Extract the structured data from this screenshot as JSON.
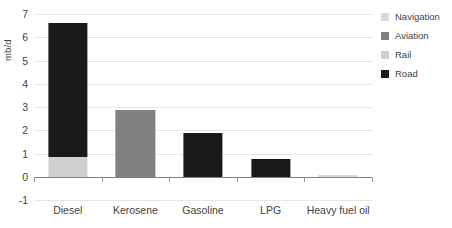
{
  "chart_data": {
    "type": "bar",
    "title": "",
    "subtitle": "",
    "xlabel": "",
    "ylabel": "mb/d",
    "ylim": [
      -1,
      7
    ],
    "ytick_labels": [
      "7",
      "6",
      "5",
      "4",
      "3",
      "2",
      "1",
      "0",
      "-1"
    ],
    "ytick_values": [
      7,
      6,
      5,
      4,
      3,
      2,
      1,
      0,
      -1
    ],
    "grid": true,
    "stacked": true,
    "legend_position": "right",
    "categories": [
      "Diesel",
      "Kerosene",
      "Gasoline",
      "LPG",
      "Heavy fuel oil"
    ],
    "series": [
      {
        "name": "Navigation",
        "color": "#d9d9d9",
        "values": [
          0,
          0,
          0,
          0,
          0.06
        ]
      },
      {
        "name": "Aviation",
        "color": "#808080",
        "values": [
          0,
          2.88,
          0,
          0,
          0
        ]
      },
      {
        "name": "Rail",
        "color": "#d0d0d0",
        "values": [
          0.83,
          0,
          0,
          0,
          0
        ]
      },
      {
        "name": "Road",
        "color": "#1a1a1a",
        "values": [
          5.78,
          0,
          1.9,
          0.75,
          0
        ]
      }
    ],
    "totals": [
      6.61,
      2.88,
      1.9,
      0.75,
      0.06
    ]
  },
  "legend": {
    "items": [
      {
        "label": "Navigation",
        "color": "#d9d9d9"
      },
      {
        "label": "Aviation",
        "color": "#808080"
      },
      {
        "label": "Rail",
        "color": "#d0d0d0"
      },
      {
        "label": "Road",
        "color": "#1a1a1a"
      }
    ]
  },
  "axis": {
    "y_title": "mb/d"
  }
}
